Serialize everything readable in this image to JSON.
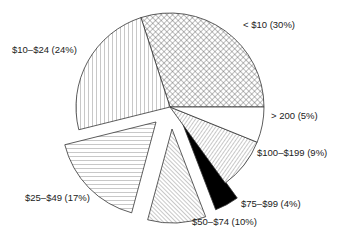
{
  "chart_data": {
    "type": "pie",
    "title": "",
    "categories": [
      "< $10",
      "$10–$24",
      "$25–$49",
      "$50–$74",
      "$75–$99",
      "$100–$199",
      "> 200"
    ],
    "values": [
      30,
      24,
      17,
      10,
      4,
      9,
      5
    ],
    "unit": "%",
    "exploded": [
      false,
      false,
      true,
      true,
      true,
      false,
      false
    ],
    "patterns": [
      "crosshatch",
      "vertical-lines",
      "horizontal-lines",
      "diagonal-lines",
      "solid-black",
      "diagonal-lines-dense",
      "blank"
    ],
    "legend": "none (direct labels)",
    "labels": [
      "< $10 (30%)",
      "$10–$24 (24%)",
      "$25–$49 (17%)",
      "$50–$74 (10%)",
      "$75–$99 (4%)",
      "$100–$199 (9%)",
      "> 200 (5%)"
    ]
  },
  "geometry": {
    "cx": 170,
    "cy": 107,
    "r": 94,
    "slices": [
      {
        "start": 0,
        "end": 108,
        "dx": 0,
        "dy": 0
      },
      {
        "start": 108,
        "end": 194,
        "dx": 0,
        "dy": 0
      },
      {
        "start": 194,
        "end": 255,
        "dx": -14,
        "dy": 15
      },
      {
        "start": 255,
        "end": 291,
        "dx": 2,
        "dy": 22
      },
      {
        "start": 291,
        "end": 306,
        "dx": 12,
        "dy": 15
      },
      {
        "start": 306,
        "end": 338,
        "dx": 0,
        "dy": 0
      },
      {
        "start": 338,
        "end": 360,
        "dx": 0,
        "dy": 0
      }
    ],
    "label_positions": [
      {
        "x": 243,
        "y": 28
      },
      {
        "x": 12,
        "y": 53
      },
      {
        "x": 25,
        "y": 201
      },
      {
        "x": 192,
        "y": 225
      },
      {
        "x": 241,
        "y": 207
      },
      {
        "x": 257,
        "y": 156
      },
      {
        "x": 271,
        "y": 119
      }
    ]
  }
}
